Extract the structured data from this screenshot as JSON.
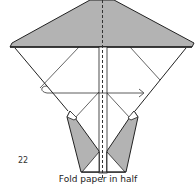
{
  "diagram": {
    "step_number": "22",
    "caption": "Fold paper in half",
    "colors": {
      "shaded_paper": "#b3b3b3",
      "line": "#222222",
      "background": "#ffffff"
    },
    "annotations": {
      "fold_line": "vertical dashed center valley fold",
      "arrow": "left-to-right fold arrow across middle"
    }
  }
}
